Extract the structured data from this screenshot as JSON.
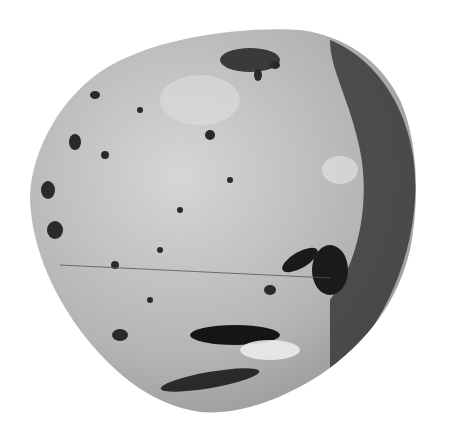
{
  "image": {
    "subject": "cratered irregular moon body (grayscale photograph)",
    "background_color": "#ffffff",
    "surface_base_color": "#b8b8b8",
    "shadow_color": "#1e1e1e",
    "highlight_color": "#e8e8e8"
  }
}
